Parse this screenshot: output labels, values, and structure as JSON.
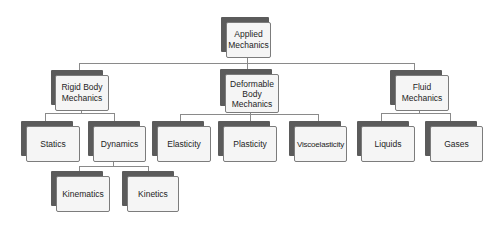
{
  "diagram": {
    "type": "hierarchy-tree",
    "root": {
      "label": "Applied\nMechanics",
      "children": [
        {
          "label": "Rigid Body\nMechanics",
          "children": [
            {
              "label": "Statics"
            },
            {
              "label": "Dynamics",
              "children": [
                {
                  "label": "Kinematics"
                },
                {
                  "label": "Kinetics"
                }
              ]
            }
          ]
        },
        {
          "label": "Deformable\nBody\nMechanics",
          "children": [
            {
              "label": "Elasticity"
            },
            {
              "label": "Plasticity"
            },
            {
              "label": "Viscoelasticity"
            }
          ]
        },
        {
          "label": "Fluid\nMechanics",
          "children": [
            {
              "label": "Liquids"
            },
            {
              "label": "Gases"
            }
          ]
        }
      ]
    }
  },
  "nodes": {
    "applied_mechanics": "Applied\nMechanics",
    "rigid_body_mechanics": "Rigid Body\nMechanics",
    "deformable_body_mechanics": "Deformable\nBody\nMechanics",
    "fluid_mechanics": "Fluid\nMechanics",
    "statics": "Statics",
    "dynamics": "Dynamics",
    "kinematics": "Kinematics",
    "kinetics": "Kinetics",
    "elasticity": "Elasticity",
    "plasticity": "Plasticity",
    "viscoelasticity": "Viscoelasticity",
    "liquids": "Liquids",
    "gases": "Gases"
  },
  "colors": {
    "shadow": "#5b5b5b",
    "box_fill": "#f5f5f5",
    "box_border": "#7c7c7c",
    "connector": "#8a8a8a",
    "text": "#1e1e1e"
  }
}
